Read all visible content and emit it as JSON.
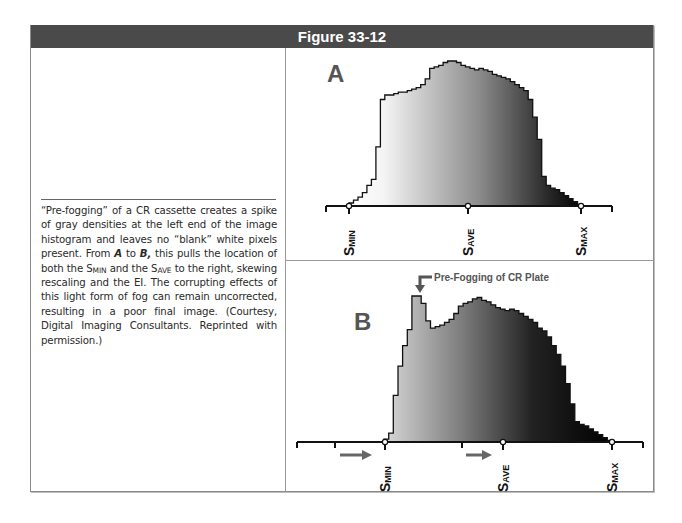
{
  "figure": {
    "title": "Figure 33-12",
    "caption": {
      "part1": "“Pre-fogging” of a CR cassette creates a spike of gray densities at the left end of the image histogram and leaves no “blank” white pixels present. From ",
      "a": "A",
      "to": " to ",
      "b": "B,",
      "part2": " this pulls the location of both the S",
      "sub_min": "MIN",
      "part3": " and the S",
      "sub_ave": "AVE",
      "part4": " to the right, skewing rescaling and the EI. The corrupting effects of this light form of fog can remain uncorrected, resulting in a poor final image. (Courtesy, Digital Imaging Consultants. Reprinted with permission.)"
    },
    "colors": {
      "header_bg": "#4a4a4a",
      "header_text": "#ffffff",
      "axis": "#111111",
      "arrow": "#555555",
      "label_letter": "#555555"
    }
  },
  "chart_data": [
    {
      "type": "bar",
      "panel_label": "A",
      "title": "Normal image histogram",
      "xlabel": "Pixel value (density)",
      "axis_labels": [
        "S_MIN",
        "S_AVE",
        "S_MAX"
      ],
      "axis_label_positions": [
        0.1,
        0.5,
        0.88
      ],
      "values": [
        2,
        4,
        6,
        9,
        14,
        18,
        40,
        72,
        75,
        75,
        76,
        77,
        77,
        78,
        79,
        80,
        82,
        86,
        93,
        94,
        95,
        97,
        98,
        98,
        97,
        95,
        94,
        93,
        92,
        93,
        92,
        91,
        89,
        88,
        87,
        86,
        84,
        82,
        80,
        78,
        72,
        60,
        45,
        20,
        14,
        12,
        11,
        9,
        7,
        5,
        3,
        1
      ]
    },
    {
      "type": "bar",
      "panel_label": "B",
      "title": "Pre-fogged image histogram",
      "annotation": "Pre-Fogging of CR Plate",
      "xlabel": "Pixel value (density)",
      "axis_labels": [
        "S_MIN",
        "S_AVE",
        "S_MAX"
      ],
      "axis_label_positions": [
        0.25,
        0.59,
        0.92
      ],
      "shift_arrows": 2,
      "values": [
        2,
        6,
        32,
        52,
        66,
        77,
        100,
        100,
        95,
        83,
        78,
        79,
        80,
        82,
        84,
        88,
        93,
        95,
        96,
        98,
        99,
        97,
        96,
        94,
        92,
        91,
        90,
        91,
        90,
        88,
        86,
        84,
        82,
        78,
        76,
        72,
        66,
        60,
        52,
        40,
        26,
        14,
        12,
        11,
        9,
        7,
        5,
        3,
        1
      ]
    }
  ]
}
